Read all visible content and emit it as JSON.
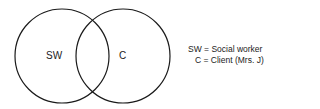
{
  "diagram": {
    "type": "venn",
    "circles": [
      {
        "id": "sw",
        "label": "SW"
      },
      {
        "id": "c",
        "label": "C"
      }
    ],
    "legend": [
      {
        "key": "SW",
        "text": "SW = Social worker"
      },
      {
        "key": "C",
        "text": "C = Client (Mrs. J)"
      }
    ]
  }
}
